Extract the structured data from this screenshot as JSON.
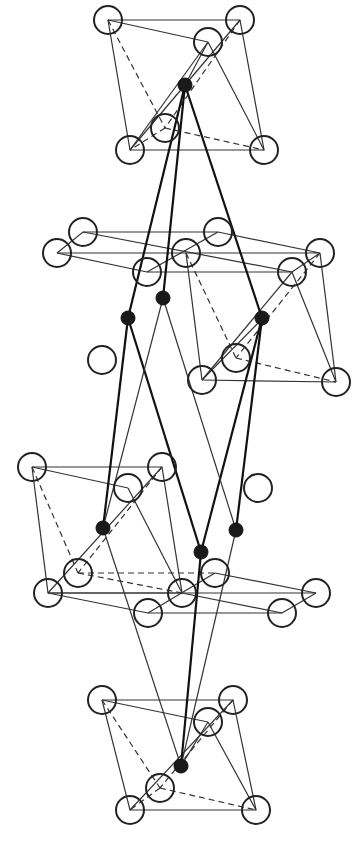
{
  "figure": {
    "width": 358,
    "height": 861,
    "colors": {
      "line": "#333333",
      "bond": "#111111",
      "cation": "#1a1a1a",
      "background": "#ffffff"
    }
  },
  "legend": {
    "open_circle": "anion site",
    "filled_circle": "cation site"
  },
  "open_atoms": [
    [
      108,
      20
    ],
    [
      240,
      20
    ],
    [
      208,
      42
    ],
    [
      130,
      150
    ],
    [
      264,
      150
    ],
    [
      165,
      128
    ],
    [
      57,
      253
    ],
    [
      83,
      232
    ],
    [
      186,
      253
    ],
    [
      218,
      232
    ],
    [
      320,
      253
    ],
    [
      292,
      272
    ],
    [
      147,
      272
    ],
    [
      102,
      360
    ],
    [
      202,
      380
    ],
    [
      236,
      358
    ],
    [
      336,
      382
    ],
    [
      32,
      467
    ],
    [
      162,
      467
    ],
    [
      128,
      488
    ],
    [
      258,
      488
    ],
    [
      78,
      573
    ],
    [
      48,
      593
    ],
    [
      182,
      593
    ],
    [
      215,
      573
    ],
    [
      148,
      613
    ],
    [
      316,
      593
    ],
    [
      282,
      613
    ],
    [
      102,
      700
    ],
    [
      233,
      700
    ],
    [
      208,
      722
    ],
    [
      130,
      810
    ],
    [
      256,
      810
    ],
    [
      160,
      788
    ]
  ],
  "solid_atoms": [
    [
      185,
      85
    ],
    [
      163,
      298
    ],
    [
      128,
      318
    ],
    [
      262,
      318
    ],
    [
      103,
      528
    ],
    [
      201,
      552
    ],
    [
      236,
      530
    ],
    [
      181,
      766
    ]
  ]
}
